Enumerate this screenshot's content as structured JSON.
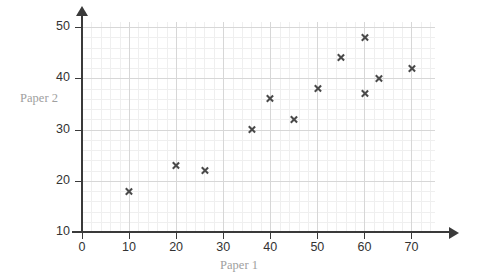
{
  "chart_data": {
    "type": "scatter",
    "title": "",
    "xlabel": "Paper 1",
    "ylabel": "Paper 2",
    "xlim": [
      0,
      75
    ],
    "ylim": [
      10,
      51
    ],
    "x_ticks": [
      0,
      10,
      20,
      30,
      40,
      50,
      60,
      70
    ],
    "y_ticks": [
      10,
      20,
      30,
      40,
      50
    ],
    "x_tick_labels": [
      "0",
      "10",
      "20",
      "30",
      "40",
      "50",
      "60",
      "70"
    ],
    "y_tick_labels": [
      "10",
      "20",
      "30",
      "40",
      "50"
    ],
    "x_minor_step": 2,
    "y_minor_step": 2,
    "grid": true,
    "legend": false,
    "marker": "x",
    "marker_color": "#4a4a4a",
    "points": [
      {
        "x": 10,
        "y": 18
      },
      {
        "x": 20,
        "y": 23
      },
      {
        "x": 26,
        "y": 22
      },
      {
        "x": 36,
        "y": 30
      },
      {
        "x": 40,
        "y": 36
      },
      {
        "x": 45,
        "y": 32
      },
      {
        "x": 50,
        "y": 38
      },
      {
        "x": 55,
        "y": 44
      },
      {
        "x": 60,
        "y": 37
      },
      {
        "x": 60,
        "y": 48
      },
      {
        "x": 63,
        "y": 40
      },
      {
        "x": 70,
        "y": 42
      }
    ]
  },
  "colors": {
    "axis": "#3a3a3a",
    "grid_major": "#d7d7d7",
    "grid_minor": "#efefef",
    "tick_label": "#333333",
    "axis_title": "#a0a0a0",
    "background": "#ffffff"
  }
}
